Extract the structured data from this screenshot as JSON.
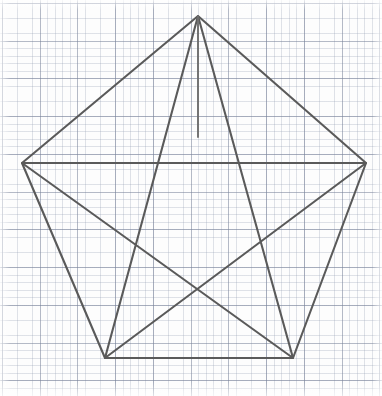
{
  "figure": {
    "background_color": "#fdfdfd",
    "paper_type": "graph-paper",
    "canvas": {
      "width": 382,
      "height": 396
    }
  },
  "grid": {
    "minor_spacing_px": 7.55,
    "major_spacing_px": 37.75,
    "minor_color": "#96a0b4",
    "major_color": "#788299",
    "minor_opacity": 0.3,
    "major_opacity": 0.55,
    "offset_x": 2,
    "offset_y": 3
  },
  "style": {
    "line_color": "#5a5a5a",
    "line_color_light": "#6e6e6e",
    "line_width": 2.1,
    "line_width_thin": 1.9,
    "line_cap": "round",
    "line_join": "round"
  },
  "geometry": {
    "pentagon_vertices": {
      "apex": {
        "label": "A",
        "x": 198,
        "y": 16
      },
      "left": {
        "label": "B",
        "x": 22,
        "y": 163
      },
      "right": {
        "label": "E",
        "x": 366,
        "y": 163
      },
      "bottom_left": {
        "label": "C",
        "x": 105,
        "y": 358
      },
      "bottom_right": {
        "label": "D",
        "x": 293,
        "y": 358
      }
    },
    "star_inner_points": {
      "top": {
        "x": 198,
        "y": 137
      },
      "upper_left": {
        "x": 104,
        "y": 189
      },
      "upper_right": {
        "x": 296,
        "y": 189
      },
      "lower_left": {
        "x": 128,
        "y": 310
      },
      "lower_right": {
        "x": 268,
        "y": 310
      }
    },
    "pentagon_edges": [
      {
        "name": "edge-apex-left",
        "from": "apex",
        "to": "left"
      },
      {
        "name": "edge-apex-right",
        "from": "apex",
        "to": "right"
      },
      {
        "name": "edge-left-bottomleft",
        "from": "left",
        "to": "bottom_left"
      },
      {
        "name": "edge-right-bottomright",
        "from": "right",
        "to": "bottom_right"
      },
      {
        "name": "edge-bottomleft-bottomright",
        "from": "bottom_left",
        "to": "bottom_right"
      }
    ],
    "pentagram_chords": [
      {
        "name": "chord-apex-bottomleft",
        "from": "apex",
        "to": "bottom_left"
      },
      {
        "name": "chord-apex-bottomright",
        "from": "apex",
        "to": "bottom_right"
      },
      {
        "name": "chord-left-bottomright",
        "from": "left",
        "to": "bottom_right"
      },
      {
        "name": "chord-right-bottomleft",
        "from": "right",
        "to": "bottom_left"
      },
      {
        "name": "chord-left-right",
        "from": "left",
        "to": "right"
      }
    ],
    "extra_segments": [
      {
        "name": "segment-apex-to-star-top",
        "from": "apex",
        "to": "star_top",
        "x1": 198,
        "y1": 16,
        "x2": 198,
        "y2": 137
      }
    ]
  },
  "paths": {
    "pentagon_outline": "M 198 16 L 22 163 L 105 358 L 293 358 L 366 163 Z",
    "pentagram_outline": "M 198 16 L 293 358 L 22 163 L 366 163 L 105 358 Z",
    "apex_vertical": "M 198 16 L 198 137"
  }
}
